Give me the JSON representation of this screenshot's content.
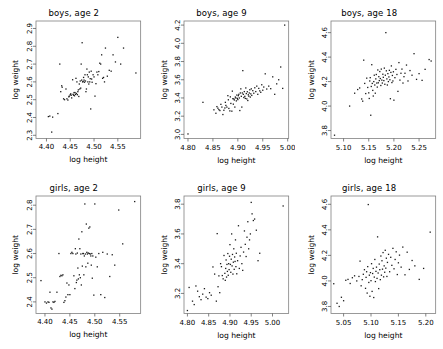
{
  "figure": {
    "background": "#ffffff",
    "point_color": "#1a1a1a",
    "frame_color": "#808080",
    "rows": 2,
    "cols": 3
  },
  "chart_data": [
    {
      "type": "scatter",
      "title": "boys, age 2",
      "xlabel": "log height",
      "ylabel": "log weight",
      "xlim": [
        4.378,
        4.598
      ],
      "ylim": [
        2.282,
        2.942
      ],
      "xticks": [
        4.4,
        4.45,
        4.5,
        4.55
      ],
      "xticklabels": [
        "4.40",
        "4.45",
        "4.50",
        "4.55"
      ],
      "yticks": [
        2.3,
        2.4,
        2.5,
        2.6,
        2.7,
        2.8,
        2.9
      ],
      "yticklabels": [
        "2.3",
        "2.4",
        "2.5",
        "2.6",
        "2.7",
        "2.8",
        "2.9"
      ],
      "grid": false,
      "legend": "none",
      "x": [
        4.404,
        4.407,
        4.411,
        4.413,
        4.424,
        4.428,
        4.43,
        4.432,
        4.433,
        4.436,
        4.438,
        4.441,
        4.443,
        4.445,
        4.447,
        4.448,
        4.45,
        4.451,
        4.452,
        4.453,
        4.455,
        4.456,
        4.457,
        4.458,
        4.459,
        4.46,
        4.461,
        4.462,
        4.463,
        4.464,
        4.465,
        4.466,
        4.467,
        4.468,
        4.469,
        4.47,
        4.471,
        4.472,
        4.473,
        4.474,
        4.475,
        4.476,
        4.477,
        4.478,
        4.479,
        4.48,
        4.481,
        4.482,
        4.483,
        4.484,
        4.485,
        4.486,
        4.487,
        4.488,
        4.489,
        4.49,
        4.491,
        4.492,
        4.493,
        4.494,
        4.495,
        4.496,
        4.498,
        4.5,
        4.502,
        4.504,
        4.506,
        4.508,
        4.51,
        4.512,
        4.514,
        4.516,
        4.518,
        4.52,
        4.522,
        4.524,
        4.528,
        4.532,
        4.536,
        4.54,
        4.545,
        4.55,
        4.556,
        4.562,
        4.588
      ],
      "y": [
        2.405,
        2.408,
        2.318,
        2.402,
        2.422,
        2.7,
        2.545,
        2.578,
        2.57,
        2.505,
        2.5,
        2.56,
        2.505,
        2.498,
        2.516,
        2.52,
        2.528,
        2.533,
        2.525,
        2.51,
        2.612,
        2.53,
        2.525,
        2.54,
        2.522,
        2.54,
        2.53,
        2.62,
        2.535,
        2.6,
        2.528,
        2.545,
        2.555,
        2.518,
        2.588,
        2.56,
        2.605,
        2.565,
        2.7,
        2.61,
        2.82,
        2.6,
        2.602,
        2.625,
        2.61,
        2.598,
        2.64,
        2.605,
        2.545,
        2.56,
        2.672,
        2.64,
        2.6,
        2.628,
        2.588,
        2.655,
        2.6,
        2.618,
        2.448,
        2.66,
        2.616,
        2.598,
        2.64,
        2.628,
        2.52,
        2.59,
        2.655,
        2.64,
        2.658,
        2.705,
        2.7,
        2.752,
        2.62,
        2.625,
        2.6,
        2.79,
        2.632,
        2.665,
        2.66,
        2.752,
        2.712,
        2.85,
        2.7,
        2.79,
        2.65
      ]
    },
    {
      "type": "scatter",
      "title": "boys, age 9",
      "xlabel": "log height",
      "ylabel": "log weight",
      "xlim": [
        4.792,
        5.002
      ],
      "ylim": [
        2.955,
        4.245
      ],
      "xticks": [
        4.8,
        4.85,
        4.9,
        4.95,
        5.0
      ],
      "xticklabels": [
        "4.80",
        "4.85",
        "4.90",
        "4.95",
        "5.00"
      ],
      "yticks": [
        3.0,
        3.2,
        3.4,
        3.6,
        3.8,
        4.0,
        4.2
      ],
      "yticklabels": [
        "3.0",
        "3.2",
        "3.4",
        "3.6",
        "3.8",
        "4.0",
        "4.2"
      ],
      "grid": false,
      "legend": "none",
      "x": [
        4.8,
        4.83,
        4.852,
        4.856,
        4.858,
        4.86,
        4.862,
        4.864,
        4.866,
        4.868,
        4.87,
        4.872,
        4.874,
        4.875,
        4.876,
        4.878,
        4.88,
        4.881,
        4.882,
        4.884,
        4.885,
        4.886,
        4.888,
        4.889,
        4.89,
        4.891,
        4.892,
        4.893,
        4.894,
        4.895,
        4.896,
        4.897,
        4.898,
        4.899,
        4.9,
        4.901,
        4.902,
        4.903,
        4.904,
        4.905,
        4.906,
        4.907,
        4.908,
        4.909,
        4.91,
        4.911,
        4.912,
        4.913,
        4.914,
        4.915,
        4.916,
        4.917,
        4.918,
        4.919,
        4.92,
        4.921,
        4.922,
        4.923,
        4.924,
        4.925,
        4.926,
        4.927,
        4.928,
        4.93,
        4.932,
        4.934,
        4.936,
        4.938,
        4.94,
        4.942,
        4.944,
        4.946,
        4.948,
        4.95,
        4.952,
        4.955,
        4.958,
        4.962,
        4.966,
        4.97,
        4.974,
        4.978,
        4.982,
        4.986,
        4.99,
        4.994
      ],
      "y": [
        3.005,
        3.352,
        3.27,
        3.232,
        3.305,
        3.288,
        3.272,
        3.262,
        3.33,
        3.3,
        3.218,
        3.265,
        3.29,
        3.352,
        3.318,
        3.3,
        3.425,
        3.38,
        3.285,
        3.258,
        3.412,
        3.34,
        3.255,
        3.475,
        3.392,
        3.332,
        3.39,
        3.378,
        3.3,
        3.41,
        3.4,
        3.368,
        3.432,
        3.395,
        3.382,
        3.425,
        3.44,
        3.4,
        3.262,
        3.455,
        3.5,
        3.418,
        3.3,
        3.455,
        3.7,
        3.44,
        3.405,
        3.47,
        3.418,
        3.395,
        3.51,
        3.448,
        3.39,
        3.468,
        3.372,
        3.435,
        3.42,
        3.455,
        3.49,
        3.41,
        3.445,
        3.5,
        3.428,
        3.48,
        3.452,
        3.512,
        3.47,
        3.53,
        3.44,
        3.505,
        3.478,
        3.462,
        3.545,
        3.485,
        3.52,
        3.665,
        3.498,
        3.53,
        3.502,
        3.632,
        3.44,
        3.555,
        3.6,
        3.74,
        3.505,
        4.2
      ]
    },
    {
      "type": "scatter",
      "title": "boys, age 18",
      "xlabel": "log height",
      "ylabel": "log weight",
      "xlim": [
        5.075,
        5.283
      ],
      "ylim": [
        3.735,
        4.695
      ],
      "xticks": [
        5.1,
        5.15,
        5.2,
        5.25
      ],
      "xticklabels": [
        "5.10",
        "5.15",
        "5.20",
        "5.25"
      ],
      "yticks": [
        3.8,
        4.0,
        4.2,
        4.4,
        4.6
      ],
      "yticklabels": [
        "3.8",
        "4.0",
        "4.2",
        "4.4",
        "4.6"
      ],
      "grid": false,
      "legend": "none",
      "x": [
        5.082,
        5.112,
        5.122,
        5.128,
        5.132,
        5.136,
        5.138,
        5.14,
        5.142,
        5.144,
        5.146,
        5.148,
        5.15,
        5.151,
        5.152,
        5.153,
        5.154,
        5.155,
        5.156,
        5.157,
        5.158,
        5.159,
        5.16,
        5.161,
        5.162,
        5.163,
        5.164,
        5.165,
        5.166,
        5.167,
        5.168,
        5.169,
        5.17,
        5.171,
        5.172,
        5.173,
        5.174,
        5.175,
        5.176,
        5.177,
        5.178,
        5.179,
        5.18,
        5.181,
        5.182,
        5.183,
        5.184,
        5.185,
        5.186,
        5.187,
        5.188,
        5.189,
        5.19,
        5.191,
        5.192,
        5.193,
        5.194,
        5.195,
        5.196,
        5.197,
        5.198,
        5.199,
        5.2,
        5.202,
        5.204,
        5.206,
        5.208,
        5.21,
        5.212,
        5.214,
        5.216,
        5.218,
        5.22,
        5.222,
        5.225,
        5.228,
        5.232,
        5.236,
        5.24,
        5.245,
        5.25,
        5.256,
        5.262,
        5.27,
        5.274
      ],
      "y": [
        3.762,
        4.0,
        4.105,
        4.135,
        4.148,
        4.058,
        4.04,
        4.375,
        4.185,
        4.102,
        4.228,
        4.152,
        4.108,
        4.062,
        4.205,
        4.232,
        3.925,
        4.16,
        4.338,
        4.185,
        4.128,
        4.082,
        4.2,
        4.252,
        4.172,
        4.105,
        4.222,
        4.258,
        4.188,
        4.155,
        4.295,
        4.19,
        4.24,
        4.208,
        4.282,
        4.225,
        4.168,
        4.302,
        4.212,
        4.188,
        4.26,
        4.235,
        4.208,
        4.31,
        4.178,
        4.252,
        4.6,
        4.288,
        4.222,
        4.172,
        4.265,
        4.2,
        4.238,
        4.292,
        4.215,
        4.06,
        4.275,
        4.328,
        4.192,
        4.25,
        4.205,
        4.28,
        4.048,
        4.232,
        4.3,
        4.258,
        4.12,
        4.355,
        4.212,
        4.268,
        4.302,
        4.188,
        4.24,
        4.268,
        4.335,
        4.205,
        4.29,
        4.252,
        4.428,
        4.218,
        4.265,
        4.21,
        4.3,
        4.38,
        4.368
      ]
    },
    {
      "type": "scatter",
      "title": "girls, age 2",
      "xlabel": "log height",
      "ylabel": "log weight",
      "xlim": [
        4.382,
        4.592
      ],
      "ylim": [
        2.352,
        2.838
      ],
      "xticks": [
        4.4,
        4.45,
        4.5,
        4.55
      ],
      "xticklabels": [
        "4.40",
        "4.45",
        "4.50",
        "4.55"
      ],
      "yticks": [
        2.4,
        2.5,
        2.6,
        2.7,
        2.8
      ],
      "yticklabels": [
        "2.4",
        "2.5",
        "2.6",
        "2.7",
        "2.8"
      ],
      "grid": false,
      "legend": "none",
      "x": [
        4.392,
        4.4,
        4.403,
        4.406,
        4.408,
        4.41,
        4.412,
        4.414,
        4.416,
        4.418,
        4.42,
        4.424,
        4.428,
        4.43,
        4.432,
        4.434,
        4.436,
        4.438,
        4.44,
        4.442,
        4.444,
        4.446,
        4.448,
        4.45,
        4.452,
        4.454,
        4.456,
        4.458,
        4.46,
        4.461,
        4.462,
        4.463,
        4.464,
        4.465,
        4.466,
        4.467,
        4.468,
        4.469,
        4.47,
        4.471,
        4.472,
        4.473,
        4.474,
        4.475,
        4.476,
        4.477,
        4.478,
        4.479,
        4.48,
        4.481,
        4.482,
        4.483,
        4.484,
        4.485,
        4.486,
        4.487,
        4.488,
        4.489,
        4.49,
        4.491,
        4.492,
        4.493,
        4.494,
        4.495,
        4.496,
        4.498,
        4.5,
        4.502,
        4.505,
        4.508,
        4.512,
        4.516,
        4.52,
        4.525,
        4.53,
        4.535,
        4.54,
        4.548,
        4.556,
        4.58
      ],
      "y": [
        2.488,
        2.4,
        2.395,
        2.4,
        2.398,
        2.44,
        2.375,
        2.37,
        2.4,
        2.398,
        2.402,
        2.44,
        2.6,
        2.505,
        2.51,
        2.508,
        2.512,
        2.398,
        2.405,
        2.42,
        2.478,
        2.43,
        2.47,
        2.43,
        2.6,
        2.605,
        2.6,
        2.508,
        2.455,
        2.62,
        2.598,
        2.48,
        2.49,
        2.602,
        2.54,
        2.495,
        2.66,
        2.512,
        2.62,
        2.5,
        2.598,
        2.47,
        2.69,
        2.548,
        2.6,
        2.6,
        2.512,
        2.59,
        2.805,
        2.598,
        2.545,
        2.722,
        2.605,
        2.598,
        2.56,
        2.602,
        2.705,
        2.6,
        2.71,
        2.598,
        2.59,
        2.552,
        2.6,
        2.498,
        2.59,
        2.428,
        2.805,
        2.585,
        2.545,
        2.6,
        2.43,
        2.605,
        2.418,
        2.598,
        2.505,
        2.595,
        2.552,
        2.78,
        2.64,
        2.815
      ]
    },
    {
      "type": "scatter",
      "title": "girls, age 9",
      "xlabel": "log height",
      "ylabel": "log weight",
      "xlim": [
        4.792,
        5.038
      ],
      "ylim": [
        3.065,
        3.855
      ],
      "xticks": [
        4.8,
        4.85,
        4.9,
        4.95,
        5.0
      ],
      "xticklabels": [
        "4.80",
        "4.85",
        "4.90",
        "4.95",
        "5.00"
      ],
      "yticks": [
        3.2,
        3.4,
        3.6,
        3.8
      ],
      "yticklabels": [
        "3.2",
        "3.4",
        "3.6",
        "3.8"
      ],
      "grid": false,
      "legend": "none",
      "x": [
        4.8,
        4.804,
        4.812,
        4.816,
        4.82,
        4.824,
        4.828,
        4.832,
        4.836,
        4.84,
        4.844,
        4.848,
        4.852,
        4.856,
        4.86,
        4.864,
        4.868,
        4.87,
        4.872,
        4.874,
        4.876,
        4.878,
        4.88,
        4.882,
        4.884,
        4.886,
        4.888,
        4.889,
        4.89,
        4.891,
        4.892,
        4.893,
        4.894,
        4.895,
        4.896,
        4.897,
        4.898,
        4.899,
        4.9,
        4.901,
        4.902,
        4.903,
        4.904,
        4.905,
        4.906,
        4.907,
        4.908,
        4.909,
        4.91,
        4.911,
        4.912,
        4.913,
        4.914,
        4.915,
        4.916,
        4.918,
        4.92,
        4.922,
        4.924,
        4.926,
        4.928,
        4.93,
        4.932,
        4.934,
        4.936,
        4.938,
        4.94,
        4.942,
        4.944,
        4.946,
        4.948,
        4.95,
        4.952,
        4.955,
        4.958,
        4.962,
        4.966,
        4.97,
        5.025
      ],
      "y": [
        3.085,
        3.24,
        3.148,
        3.125,
        3.25,
        3.215,
        3.178,
        3.158,
        3.195,
        3.232,
        3.175,
        3.165,
        3.205,
        3.188,
        3.378,
        3.33,
        3.148,
        3.602,
        3.245,
        3.318,
        3.205,
        3.4,
        3.38,
        3.32,
        3.298,
        3.455,
        3.335,
        3.288,
        3.368,
        3.425,
        3.31,
        3.395,
        3.348,
        3.468,
        3.322,
        3.4,
        3.36,
        3.45,
        3.528,
        3.395,
        3.342,
        3.43,
        3.6,
        3.385,
        3.462,
        3.33,
        3.41,
        3.5,
        3.362,
        3.445,
        3.415,
        3.56,
        3.38,
        3.47,
        3.332,
        3.42,
        3.655,
        3.368,
        3.452,
        3.51,
        3.4,
        3.355,
        3.478,
        3.62,
        3.53,
        3.448,
        3.578,
        3.682,
        3.5,
        3.56,
        3.6,
        3.812,
        3.735,
        3.69,
        3.7,
        3.625,
        3.42,
        3.47,
        3.788
      ]
    },
    {
      "type": "scatter",
      "title": "girls, age 18",
      "xlabel": "log height",
      "ylabel": "log weight",
      "xlim": [
        5.027,
        5.218
      ],
      "ylim": [
        3.745,
        4.665
      ],
      "xticks": [
        5.05,
        5.1,
        5.15,
        5.2
      ],
      "xticklabels": [
        "5.05",
        "5.10",
        "5.15",
        "5.20"
      ],
      "yticks": [
        3.8,
        4.0,
        4.2,
        4.4,
        4.6
      ],
      "yticklabels": [
        "3.8",
        "4.0",
        "4.2",
        "4.4",
        "4.6"
      ],
      "grid": false,
      "legend": "none",
      "x": [
        5.032,
        5.038,
        5.042,
        5.046,
        5.05,
        5.054,
        5.058,
        5.062,
        5.066,
        5.07,
        5.074,
        5.078,
        5.08,
        5.082,
        5.084,
        5.086,
        5.088,
        5.09,
        5.091,
        5.092,
        5.093,
        5.094,
        5.095,
        5.096,
        5.097,
        5.098,
        5.099,
        5.1,
        5.101,
        5.102,
        5.103,
        5.104,
        5.105,
        5.106,
        5.107,
        5.108,
        5.109,
        5.11,
        5.111,
        5.112,
        5.113,
        5.114,
        5.115,
        5.116,
        5.117,
        5.118,
        5.119,
        5.12,
        5.121,
        5.122,
        5.123,
        5.124,
        5.125,
        5.126,
        5.127,
        5.128,
        5.129,
        5.13,
        5.132,
        5.134,
        5.136,
        5.138,
        5.14,
        5.142,
        5.144,
        5.146,
        5.148,
        5.15,
        5.152,
        5.155,
        5.158,
        5.162,
        5.166,
        5.17,
        5.175,
        5.18,
        5.188,
        5.196,
        5.208
      ],
      "y": [
        3.978,
        3.825,
        3.8,
        3.872,
        3.845,
        4.005,
        4.012,
        3.98,
        4.025,
        4.04,
        4.0,
        4.035,
        4.155,
        3.962,
        4.01,
        4.052,
        4.088,
        3.942,
        4.028,
        4.072,
        3.905,
        4.112,
        4.598,
        3.988,
        4.045,
        3.88,
        4.065,
        4.002,
        4.135,
        3.918,
        4.058,
        4.098,
        3.87,
        4.03,
        4.168,
        3.995,
        4.075,
        4.108,
        4.02,
        4.345,
        4.062,
        3.94,
        4.132,
        4.088,
        4.01,
        4.195,
        4.045,
        4.158,
        4.092,
        4.222,
        4.032,
        4.118,
        4.068,
        4.24,
        4.1,
        4.178,
        4.035,
        4.145,
        4.208,
        4.072,
        4.185,
        4.122,
        4.255,
        4.095,
        4.168,
        4.228,
        4.05,
        4.142,
        4.202,
        4.108,
        4.265,
        4.048,
        4.225,
        4.09,
        4.16,
        4.118,
        4.012,
        4.098,
        4.382
      ]
    }
  ]
}
